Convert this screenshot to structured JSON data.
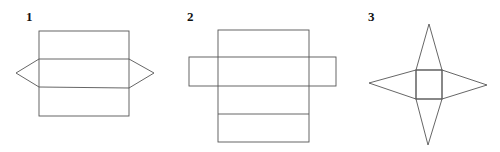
{
  "figures": [
    {
      "label": "1",
      "description": "net with stacked rectangles and triangular ends",
      "label_pos": [
        26,
        21
      ],
      "rect": {
        "x": 39,
        "y": 31,
        "w": 90,
        "h": 85
      },
      "lines": [
        [
          39,
          59,
          129,
          59
        ],
        [
          39,
          87,
          129,
          88
        ]
      ],
      "polylines": [
        [
          [
            39,
            59
          ],
          [
            16,
            73
          ],
          [
            39,
            87
          ]
        ],
        [
          [
            129,
            59
          ],
          [
            154,
            73
          ],
          [
            129,
            88
          ]
        ]
      ]
    },
    {
      "label": "2",
      "description": "net with central column and horizontal band",
      "label_pos": [
        187,
        21
      ],
      "rect": {
        "x": 218,
        "y": 30,
        "w": 91,
        "h": 112
      },
      "band": {
        "x": 189,
        "y": 57,
        "w": 147,
        "h": 29
      },
      "lines": [
        [
          218,
          114,
          309,
          114
        ]
      ]
    },
    {
      "label": "3",
      "description": "square pyramid net (square with four triangles)",
      "label_pos": [
        368,
        21
      ],
      "square": {
        "x": 416,
        "y": 70,
        "w": 26,
        "h": 29
      },
      "triangles": [
        [
          [
            416,
            70
          ],
          [
            429,
            24
          ],
          [
            442,
            70
          ]
        ],
        [
          [
            416,
            70
          ],
          [
            369,
            83
          ],
          [
            416,
            99
          ]
        ],
        [
          [
            442,
            70
          ],
          [
            487,
            85
          ],
          [
            442,
            99
          ]
        ],
        [
          [
            416,
            99
          ],
          [
            428,
            145
          ],
          [
            442,
            99
          ]
        ]
      ]
    }
  ]
}
